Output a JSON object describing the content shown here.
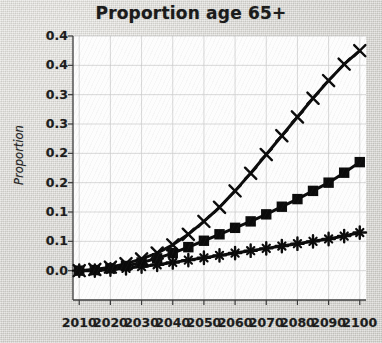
{
  "chart_data": {
    "type": "line",
    "title": "Proportion age 65+",
    "xlabel": "",
    "ylabel": "Proportion",
    "x": [
      2010,
      2015,
      2020,
      2025,
      2030,
      2035,
      2040,
      2045,
      2050,
      2055,
      2060,
      2065,
      2070,
      2075,
      2080,
      2085,
      2090,
      2095,
      2100
    ],
    "xlim": [
      2008,
      2102
    ],
    "ylim": [
      0.0,
      0.45
    ],
    "grid": true,
    "legend_position": "none",
    "xtick_labels": [
      "2010",
      "2020",
      "2030",
      "2040",
      "2050",
      "2060",
      "2070",
      "2080",
      "2090",
      "2100"
    ],
    "xtick_values": [
      2010,
      2020,
      2030,
      2040,
      2050,
      2060,
      2070,
      2080,
      2090,
      2100
    ],
    "ytick_labels": [
      "0.0",
      "0.1",
      "0.1",
      "0.2",
      "0.2",
      "0.3",
      "0.3",
      "0.4",
      "0.4"
    ],
    "ytick_values": [
      0.05,
      0.1,
      0.15,
      0.2,
      0.25,
      0.3,
      0.35,
      0.4,
      0.45
    ],
    "series": [
      {
        "name": "high-projection",
        "marker": "x",
        "values": [
          0.05,
          0.052,
          0.056,
          0.062,
          0.07,
          0.08,
          0.094,
          0.112,
          0.134,
          0.158,
          0.186,
          0.216,
          0.248,
          0.28,
          0.312,
          0.344,
          0.374,
          0.402,
          0.425
        ]
      },
      {
        "name": "medium-projection",
        "marker": "square",
        "values": [
          0.05,
          0.051,
          0.054,
          0.058,
          0.064,
          0.071,
          0.08,
          0.09,
          0.101,
          0.112,
          0.123,
          0.134,
          0.146,
          0.159,
          0.172,
          0.186,
          0.2,
          0.217,
          0.235
        ]
      },
      {
        "name": "low-projection",
        "marker": "plus",
        "values": [
          0.05,
          0.05,
          0.052,
          0.054,
          0.057,
          0.06,
          0.064,
          0.068,
          0.072,
          0.076,
          0.08,
          0.084,
          0.088,
          0.092,
          0.096,
          0.1,
          0.104,
          0.109,
          0.115
        ]
      }
    ]
  },
  "style": {
    "series_color": "#0b0b0b",
    "axis_color": "#3a3a3a",
    "grid_color": "#c9c9c9",
    "plot_background": "#fdfdfd",
    "page_background": "#d8d7d3",
    "title_color": "#1a1a1a"
  }
}
